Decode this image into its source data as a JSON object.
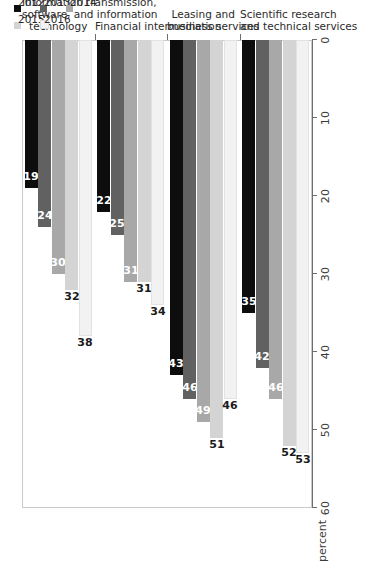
{
  "chart_data": {
    "type": "bar",
    "orientation": "horizontal",
    "title": "",
    "xlabel": "percent",
    "ylabel": "",
    "xlim": [
      0,
      60
    ],
    "xticks": [
      0,
      10,
      20,
      30,
      40,
      50,
      60
    ],
    "grid": false,
    "legend_position": "bottom-right",
    "categories": [
      "Information transmission, software, and information technology",
      "Financial intermediation",
      "Leasing and business services",
      "Scientific research and technical services"
    ],
    "category_lines": [
      [
        "Information transmission,",
        "software, and information",
        "technology"
      ],
      [
        "Financial intermediation"
      ],
      [
        "Leasing and",
        "business services"
      ],
      [
        "Scientific research",
        "and technical services"
      ]
    ],
    "series": [
      {
        "name": "2012",
        "color": "#0d0d0d",
        "values": [
          19,
          22,
          43,
          35
        ]
      },
      {
        "name": "2013",
        "color": "#616161",
        "values": [
          24,
          25,
          46,
          42
        ]
      },
      {
        "name": "2014",
        "color": "#a8a8a8",
        "values": [
          30,
          31,
          49,
          46
        ]
      },
      {
        "name": "2015",
        "color": "#d4d4d4",
        "values": [
          32,
          31,
          51,
          52
        ]
      },
      {
        "name": "2016",
        "color": "#f2f2f2",
        "values": [
          38,
          34,
          46,
          53
        ]
      }
    ]
  },
  "axis": {
    "unit_label": "percent",
    "tick_labels": [
      "60",
      "50",
      "40",
      "30",
      "20",
      "10",
      "0"
    ]
  },
  "legend": {
    "column_one": [
      "2012",
      "2013",
      "2014"
    ],
    "column_two": [
      "2015",
      "2016"
    ]
  },
  "colors": {
    "series_2012": "#0d0d0d",
    "series_2013": "#616161",
    "series_2014": "#a8a8a8",
    "series_2015": "#d4d4d4",
    "series_2016": "#f2f2f2",
    "frame": "#c9c9c9",
    "axis": "#6e6e6e",
    "text": "#2b2b2b"
  }
}
